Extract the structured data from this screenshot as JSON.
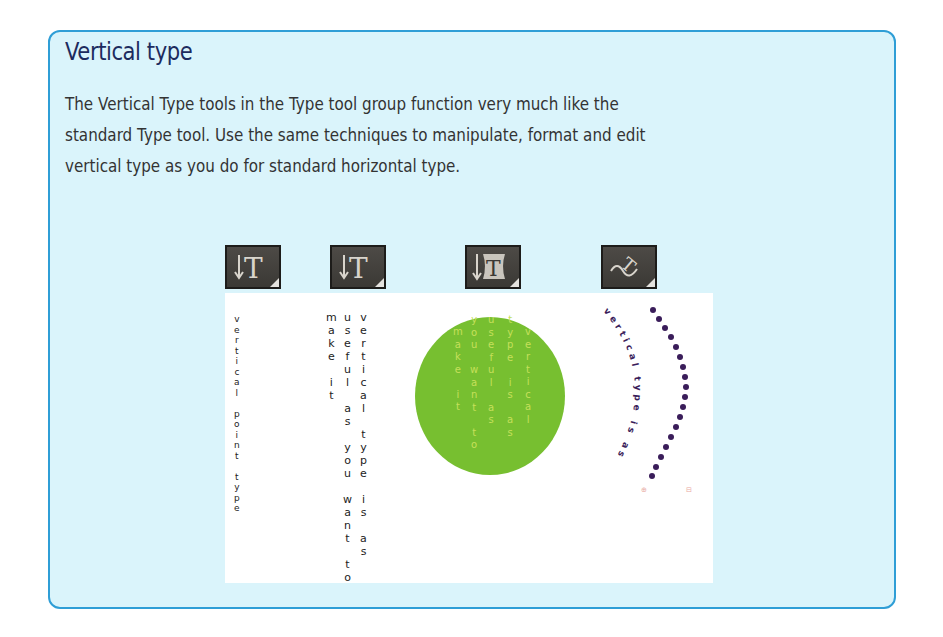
{
  "sidebar_box": {
    "title": "Vertical type",
    "paragraph_lines": [
      "The Vertical Type tools in the Type tool group function very much like the",
      "standard Type tool. Use the same techniques to manipulate, format and edit",
      "vertical type as you do for standard horizontal type."
    ]
  },
  "tools": [
    {
      "icon": "vertical-type-tool-icon",
      "label": "Vertical Type tool"
    },
    {
      "icon": "vertical-area-type-tool-icon",
      "label": "Vertical Area Type tool"
    },
    {
      "icon": "vertical-type-on-path-tool-icon",
      "label": "Vertical Type on a Path tool"
    },
    {
      "icon": "vertical-path-type-tool-icon",
      "label": "Vertical Path Type tool"
    }
  ],
  "examples": {
    "point_type": {
      "text": "vertical point type"
    },
    "area_type": {
      "columns": [
        "vertical type is as",
        "useful as you want to",
        "make it"
      ]
    },
    "circle_area_type": {
      "columns": [
        "vertical",
        "type is as",
        "useful as",
        "you want to",
        "make it"
      ],
      "fill_color": "#77bf30",
      "text_color": "#c6e05a"
    },
    "path_type": {
      "text": "vertical type is as",
      "text_color": "#3a1d5a",
      "markers": [
        "⊕",
        "⊟"
      ]
    }
  },
  "colors": {
    "box_fill": "#daf4fb",
    "box_border": "#2f9ed6",
    "title": "#1c2b5e",
    "body": "#333333"
  }
}
